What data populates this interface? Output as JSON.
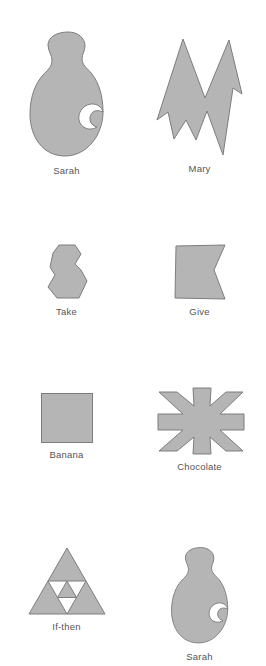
{
  "figure": {
    "background_color": "#ffffff",
    "shape_fill_color": "#b5b5b5",
    "shape_stroke_color": "#7d7d7d",
    "caption_color": "#555555",
    "columns": 2,
    "rows": 4,
    "total_items": 8
  },
  "items": [
    {
      "label": "Sarah",
      "icon": "animal-silhouette-shape",
      "row": 1,
      "column": "left"
    },
    {
      "label": "Mary",
      "icon": "angular-m-star-shape",
      "row": 1,
      "column": "right"
    },
    {
      "label": "Take",
      "icon": "small-hourglass-hexagon-shape",
      "row": 2,
      "column": "left"
    },
    {
      "label": "Give",
      "icon": "bowtie-shape",
      "row": 2,
      "column": "right"
    },
    {
      "label": "Banana",
      "icon": "square-shape",
      "row": 3,
      "column": "left"
    },
    {
      "label": "Chocolate",
      "icon": "six-point-asterisk-shape",
      "row": 3,
      "column": "right"
    },
    {
      "label": "If-then",
      "icon": "sierpinski-triangle-shape",
      "row": 4,
      "column": "left"
    },
    {
      "label": "Sarah",
      "icon": "animal-silhouette-shape",
      "row": 4,
      "column": "right"
    }
  ]
}
